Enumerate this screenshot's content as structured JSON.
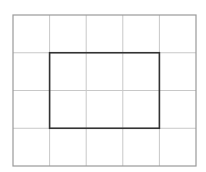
{
  "diagram": {
    "type": "grid-with-rectangle",
    "grid": {
      "columns": 5,
      "rows": 4,
      "x": 13,
      "y": 15,
      "width": 183,
      "height": 151,
      "line_color": "#c8c8c8",
      "border_color": "#9a9a9a"
    },
    "rectangle": {
      "col_start": 1,
      "col_end": 4,
      "row_start": 1,
      "row_end": 3,
      "stroke_color": "#333333",
      "stroke_width": 1.6
    }
  }
}
